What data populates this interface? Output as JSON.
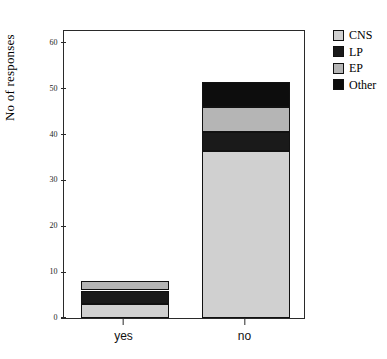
{
  "chart_data": {
    "type": "bar",
    "stacked": true,
    "title": "",
    "xlabel": "",
    "ylabel": "No of responses",
    "categories": [
      "yes",
      "no"
    ],
    "ylim": [
      0,
      63
    ],
    "yticks": [
      0,
      10,
      20,
      30,
      40,
      50,
      60
    ],
    "ytick_labels": [
      "0",
      "10",
      "20",
      "30",
      "40",
      "50",
      "60"
    ],
    "grid": false,
    "legend_position": "right",
    "series": [
      {
        "name": "CNS",
        "color": "#d0d0d0",
        "values": [
          3,
          36.5
        ]
      },
      {
        "name": "LP",
        "color": "#1a1a1a",
        "values": [
          3,
          4
        ]
      },
      {
        "name": "EP",
        "color": "#b5b5b5",
        "values": [
          2,
          5.5
        ]
      },
      {
        "name": "Other",
        "color": "#0d0d0d",
        "values": [
          0,
          5.5
        ]
      }
    ],
    "totals": [
      8,
      51.5
    ]
  },
  "legend": {
    "items": [
      {
        "label": "CNS",
        "swatch": "#d0d0d0"
      },
      {
        "label": "LP",
        "swatch": "#1a1a1a"
      },
      {
        "label": "EP",
        "swatch": "#b5b5b5"
      },
      {
        "label": "Other",
        "swatch": "#0d0d0d"
      }
    ]
  },
  "axis": {
    "y_title": "No of responses"
  }
}
